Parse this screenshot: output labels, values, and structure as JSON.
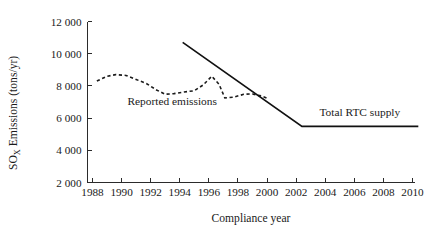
{
  "chart_data": {
    "type": "line",
    "title": "",
    "xlabel": "Compliance year",
    "ylabel": "SO_X Emissions (tons/yr)",
    "ylabel_main": "SO",
    "ylabel_sub": "X",
    "ylabel_rest": " Emissions (tons/yr)",
    "xlim": [
      1988,
      2010
    ],
    "ylim": [
      2000,
      12000
    ],
    "grid": false,
    "legend_position": "inline-annotations",
    "xticks": [
      1988,
      1990,
      1992,
      1994,
      1996,
      1998,
      2000,
      2002,
      2004,
      2006,
      2008,
      2010
    ],
    "xtick_labels": [
      "1988",
      "1990",
      "1992",
      "1994",
      "1996",
      "1998",
      "2000",
      "2002",
      "2004",
      "2006",
      "2008",
      "2010"
    ],
    "yticks": [
      2000,
      4000,
      6000,
      8000,
      10000,
      12000
    ],
    "ytick_labels": [
      "2 000",
      "4 000",
      "6 000",
      "8 000",
      "10 000",
      "12 000"
    ],
    "series": [
      {
        "name": "Reported emissions",
        "style": "dashed",
        "color": "#1b1b1b",
        "annotation": "Reported emissions",
        "annotation_x": 1990.4,
        "annotation_y": 7050,
        "x": [
          1988.3,
          1989.0,
          1989.6,
          1990.3,
          1991.0,
          1991.7,
          1992.4,
          1993.0,
          1993.6,
          1994.3,
          1995.0,
          1995.6,
          1996.2,
          1996.7,
          1997.1,
          1997.7,
          1998.4,
          1999.0,
          1999.6,
          2000.1
        ],
        "y": [
          8300,
          8600,
          8700,
          8650,
          8400,
          8150,
          7750,
          7480,
          7520,
          7620,
          7700,
          8050,
          8600,
          8100,
          7250,
          7300,
          7480,
          7500,
          7380,
          7200
        ]
      },
      {
        "name": "Total RTC supply",
        "style": "solid",
        "color": "#111111",
        "annotation": "Total RTC supply",
        "annotation_x": 2003.6,
        "annotation_y": 6350,
        "x": [
          1994.2,
          2002.4,
          2010.4
        ],
        "y": [
          10700,
          5480,
          5480
        ]
      }
    ]
  },
  "axes": {
    "x_axis_name": "compliance-year-axis",
    "y_axis_name": "sox-emissions-axis"
  }
}
